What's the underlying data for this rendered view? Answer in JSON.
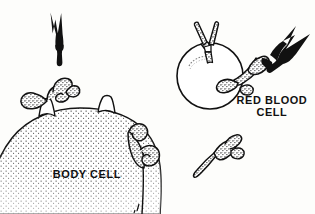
{
  "figure": {
    "type": "biology-illustration",
    "background_color": "#fdfdfb",
    "ink_color": "#111111"
  },
  "labels": {
    "red_blood_cell": {
      "line1": "RED BLOOD",
      "line2": "CELL",
      "text": "RED BLOOD\nCELL"
    },
    "body_cell": {
      "text": "BODY CELL"
    }
  },
  "elements": {
    "free_antibody_black_top_left": {
      "name": "free-antibody-black",
      "fill": "#111111",
      "prongs": 3,
      "orientation": "up"
    },
    "free_antibody_stippled_bottom_right": {
      "name": "free-antibody-stippled",
      "fill": "stipple",
      "prongs": 2,
      "orientation": "up-right"
    },
    "bound_antibody_black_right": {
      "name": "bound-antibody-black",
      "fill": "#111111",
      "prongs": 3,
      "orientation": "up-right"
    },
    "red_blood_cell_shape": {
      "name": "red-blood-cell",
      "shape": "circle",
      "bound_antibodies": 2
    },
    "body_cell_shape": {
      "name": "body-cell",
      "shape": "dome",
      "fill": "stipple",
      "bound_antibodies": 2
    }
  }
}
